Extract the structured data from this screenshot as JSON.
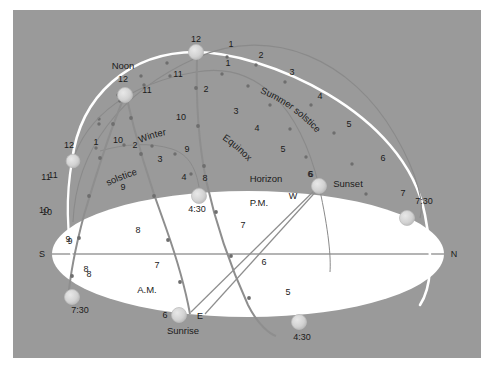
{
  "diagram": {
    "frame": {
      "background": "#9a9a9a",
      "page_background": "#ffffff"
    },
    "colors": {
      "sky": "#9a9a9a",
      "horizon_plane": "#ffffff",
      "meridian": "#ffffff",
      "sun_path_arc": "#7d7d7d",
      "hour_dot": "#6e6e6e",
      "marker_fill": "#d0d0d0",
      "marker_stroke": "#b4b4b4",
      "axis_line": "#6b6b6b",
      "text": "#1a1a1a"
    },
    "named_labels": {
      "noon": "Noon",
      "noon_hour": "12",
      "summer_solstice": "Summer solstice",
      "equinox": "Equinox",
      "winter_solstice_line1": "Winter",
      "winter_solstice_line2": "solstice",
      "horizon": "Horizon",
      "sunset": "Sunset",
      "sunrise": "Sunrise",
      "am": "A.M.",
      "pm": "P.M."
    },
    "cardinal_points": {
      "north": "N",
      "south": "S",
      "east": "E",
      "west": "W"
    },
    "endpoint_times": {
      "summer_rise": "7:30",
      "summer_set": "7:30",
      "winter_rise": "4:30",
      "winter_set": "4:30",
      "equinox_rise": "6",
      "equinox_set": "6"
    },
    "arcs": [
      {
        "name": "summer-solstice-path",
        "label": "Summer solstice",
        "rise_time": "7:30",
        "set_time": "7:30",
        "hour_marks": [
          "12",
          "1",
          "2",
          "3",
          "4",
          "5",
          "6",
          "7",
          "7:30",
          "11",
          "10",
          "9",
          "8",
          "7:30"
        ]
      },
      {
        "name": "equinox-path",
        "label": "Equinox",
        "rise_time": "6",
        "set_time": "6",
        "hour_marks": [
          "12",
          "1",
          "2",
          "3",
          "4",
          "5",
          "6",
          "11",
          "10",
          "9",
          "8",
          "7",
          "6"
        ]
      },
      {
        "name": "winter-solstice-path",
        "label": "Winter solstice",
        "rise_time": "4:30",
        "set_time": "4:30",
        "hour_marks": [
          "12",
          "1",
          "2",
          "3",
          "4",
          "4:30",
          "11",
          "10",
          "9",
          "8",
          "4:30"
        ]
      }
    ],
    "hour_numbers": {
      "summer_pm": [
        "1",
        "2",
        "3",
        "4",
        "5",
        "6",
        "7"
      ],
      "summer_am": [
        "11",
        "10",
        "9",
        "8"
      ],
      "equinox_pm": [
        "1",
        "2",
        "3",
        "4",
        "5",
        "6"
      ],
      "equinox_am": [
        "11",
        "10",
        "9",
        "8",
        "7"
      ],
      "winter_pm": [
        "1",
        "2",
        "3",
        "4"
      ],
      "winter_am": [
        "11",
        "10",
        "9",
        "8"
      ],
      "meridian_left": [
        "12",
        "11",
        "10",
        "9",
        "8"
      ],
      "center_markers": [
        "6",
        "6",
        "7",
        "7"
      ]
    },
    "top_zenith_label": "12",
    "left_meridian_label": "12"
  }
}
